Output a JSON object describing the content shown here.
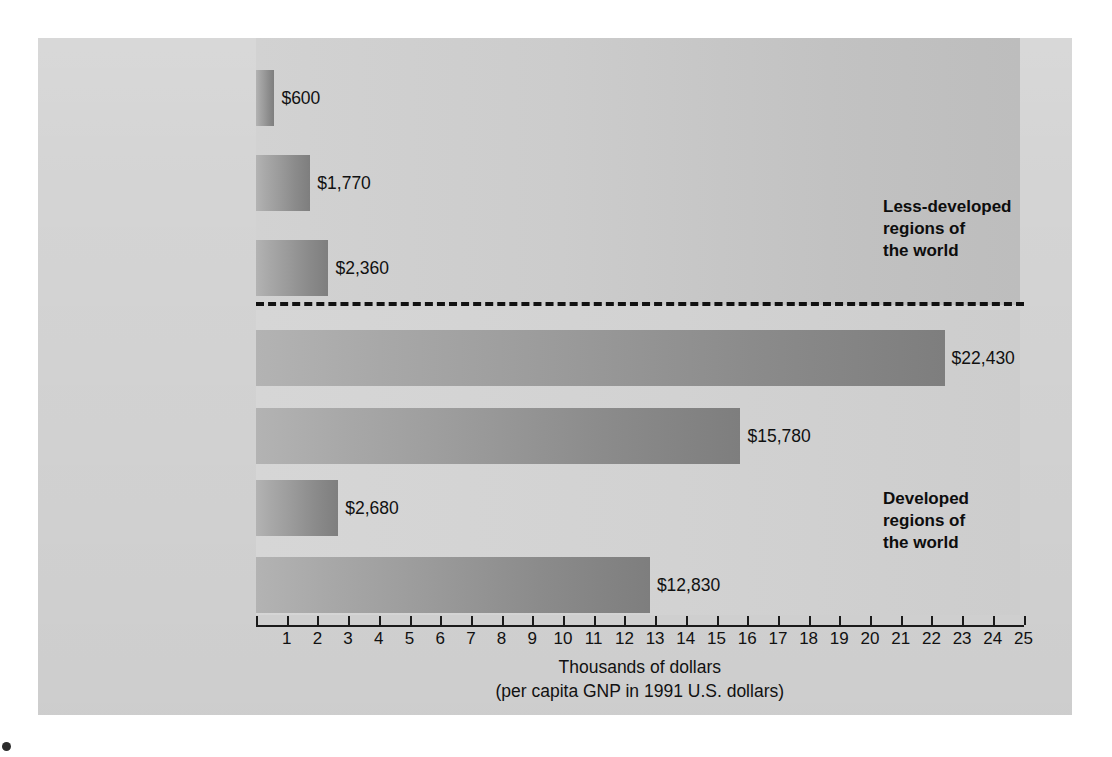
{
  "chart_data": {
    "type": "bar",
    "orientation": "horizontal",
    "categories": [
      "Africa",
      "Asia and the\nMiddle East",
      "Latin America",
      "North America",
      "Europe and\nIceland",
      "Former USSR",
      "Australia,\nNew Zealand,\nand Pacific Islands"
    ],
    "values": [
      0.6,
      1.77,
      2.36,
      22.43,
      15.78,
      2.68,
      12.83
    ],
    "value_labels": [
      "$600",
      "$1,770",
      "$2,360",
      "$22,430",
      "$15,780",
      "$2,680",
      "$12,830"
    ],
    "title": "",
    "xlabel": "Thousands of dollars\n(per capita GNP in 1991 U.S. dollars)",
    "ylabel": "",
    "xlim": [
      0,
      25
    ],
    "xticks": [
      1,
      2,
      3,
      4,
      5,
      6,
      7,
      8,
      9,
      10,
      11,
      12,
      13,
      14,
      15,
      16,
      17,
      18,
      19,
      20,
      21,
      22,
      23,
      24,
      25
    ],
    "xtick_labels": [
      "1",
      "2",
      "3",
      "4",
      "5",
      "6",
      "7",
      "8",
      "9",
      "10",
      "11",
      "12",
      "13",
      "14",
      "15",
      "16",
      "17",
      "18",
      "19",
      "20",
      "21",
      "22",
      "23",
      "24",
      "25"
    ],
    "grid": false,
    "legend": false,
    "units": "thousands of U.S. dollars (1991)",
    "annotations": [
      {
        "text": "Less-developed\nregions of\nthe world",
        "group": "upper",
        "categories": [
          "Africa",
          "Asia and the Middle East",
          "Latin America"
        ]
      },
      {
        "text": "Developed\nregions of\nthe world",
        "group": "lower",
        "categories": [
          "North America",
          "Europe and Iceland",
          "Former USSR",
          "Australia, New Zealand, and Pacific Islands"
        ]
      }
    ],
    "divider": {
      "style": "dashed",
      "between": [
        "Latin America",
        "North America"
      ]
    },
    "colors": {
      "panel_background": "#d4d4d4",
      "bar_light": "#b3b3b3",
      "bar_dark": "#7e7e7e",
      "text": "#111111",
      "axis": "#1a1a1a"
    }
  },
  "axis": {
    "caption_line1": "Thousands of dollars",
    "caption_line2": "(per capita GNP in 1991 U.S. dollars)"
  },
  "notes": {
    "less_developed": "Less-developed\nregions of\nthe world",
    "developed": "Developed\nregions of\nthe world"
  }
}
